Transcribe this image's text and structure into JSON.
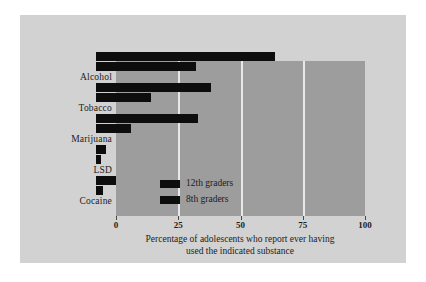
{
  "chart_data": {
    "type": "bar",
    "orientation": "horizontal",
    "title": "",
    "subtitle": "",
    "xlabel": "Percentage of adolescents who report ever having used the indicated substance",
    "ylabel": "",
    "categories": [
      "Alcohol",
      "Tobacco",
      "Marijuana",
      "LSD",
      "Cocaine"
    ],
    "series": [
      {
        "name": "12th graders",
        "values": [
          72,
          46,
          41,
          4,
          8
        ],
        "color": "#0d0d0d"
      },
      {
        "name": "8th graders",
        "values": [
          40,
          22,
          14,
          2,
          3
        ],
        "color": "#0d0d0d"
      }
    ],
    "xlim": [
      0,
      100
    ],
    "xticks": [
      0,
      25,
      50,
      75,
      100
    ],
    "xtick_labels": [
      "0",
      "25",
      "50",
      "75",
      "100"
    ],
    "grid": true,
    "grid_axis": "x",
    "legend_position": "inside-lower-left",
    "plot_background": "#9d9d9d",
    "figure_background": "#d2d2d2",
    "gridline_color": "#e8e8e8"
  },
  "caption": {
    "line1": "Percentage of adolescents who report ever having",
    "line2": "used the indicated substance"
  },
  "legend": {
    "entries": [
      {
        "label": "12th graders"
      },
      {
        "label": "8th graders"
      }
    ]
  },
  "axis": {
    "ticks": [
      {
        "value": 0,
        "label": "0"
      },
      {
        "value": 25,
        "label": "25"
      },
      {
        "value": 50,
        "label": "50"
      },
      {
        "value": 75,
        "label": "75"
      },
      {
        "value": 100,
        "label": "100"
      }
    ]
  },
  "categories": [
    {
      "label": "Alcohol"
    },
    {
      "label": "Tobacco"
    },
    {
      "label": "Marijuana"
    },
    {
      "label": "LSD"
    },
    {
      "label": "Cocaine"
    }
  ]
}
